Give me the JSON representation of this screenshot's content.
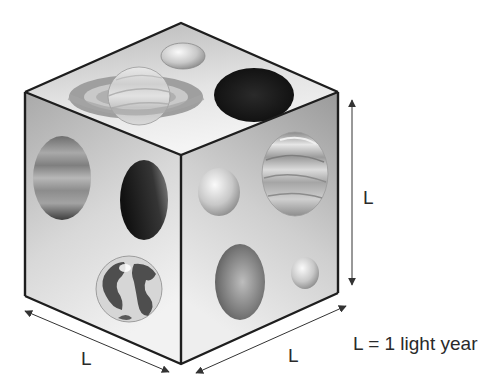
{
  "figure": {
    "dimension_labels": {
      "vertical": "L",
      "front_left": "L",
      "front_right": "L"
    },
    "caption": "L = 1 light year",
    "faces": {
      "top": [
        "saturn-with-rings",
        "small-moon",
        "dark-planet"
      ],
      "left": [
        "jupiter",
        "dark-crescent-planet",
        "earth"
      ],
      "right": [
        "small-pale-planet",
        "banded-gas-giant",
        "red-planet",
        "tiny-planet"
      ]
    },
    "colors": {
      "edge": "#1e1e1e",
      "top_face": "#d9d9d9",
      "left_face": "#c4c4c4",
      "right_face": "#bdbdbd",
      "arrow": "#333333"
    }
  }
}
